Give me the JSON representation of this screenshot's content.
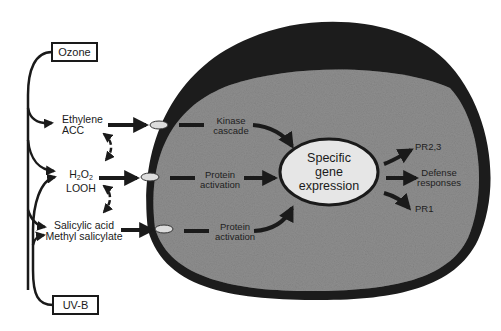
{
  "diagram": {
    "stressors": [
      {
        "id": "ozone",
        "label": "Ozone"
      },
      {
        "id": "uvb",
        "label": "UV-B"
      }
    ],
    "signals": [
      {
        "id": "ethylene",
        "line1": "Ethylene",
        "line2": "ACC"
      },
      {
        "id": "h2o2",
        "line1_main": "H",
        "line1_sub1": "2",
        "line1_mid": "O",
        "line1_sub2": "2",
        "line2": "LOOH"
      },
      {
        "id": "salicylic",
        "line1": "Salicylic acid",
        "line2": "Methyl salicylate"
      }
    ],
    "pathways": [
      {
        "line1": "Kinase",
        "line2": "cascade"
      },
      {
        "line1": "Protein",
        "line2": "activation"
      },
      {
        "line1": "Protein",
        "line2": "activation"
      }
    ],
    "core": {
      "line1": "Specific",
      "line2": "gene",
      "line3": "expression"
    },
    "outputs": [
      {
        "label": "PR2,3"
      },
      {
        "line1": "Defense",
        "line2": "responses"
      },
      {
        "label": "PR1"
      }
    ],
    "colors": {
      "cell_wall": "#1c1c1c",
      "cytoplasm": "#8e8e8e",
      "nucleus": "#e6e6e6",
      "arrows": "#1a1a1a",
      "receptor": "#dcdcdc"
    }
  }
}
